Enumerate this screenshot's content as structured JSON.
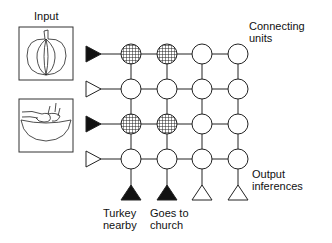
{
  "labels": {
    "input": "Input",
    "connecting_units": "Connecting\nunits",
    "output_inferences": "Output\ninferences"
  },
  "input_images": [
    {
      "name": "pumpkin-image",
      "description": "pumpkin"
    },
    {
      "name": "bowl-image",
      "description": "hands in bowl"
    }
  ],
  "input_units": [
    {
      "active": true
    },
    {
      "active": false
    },
    {
      "active": true
    },
    {
      "active": false
    }
  ],
  "connecting_units": [
    [
      true,
      true,
      false,
      false
    ],
    [
      false,
      false,
      false,
      false
    ],
    [
      true,
      true,
      false,
      false
    ],
    [
      false,
      false,
      false,
      false
    ]
  ],
  "output_units": [
    {
      "active": true,
      "label": "Turkey\nnearby"
    },
    {
      "active": true,
      "label": "Goes to\nchurch"
    },
    {
      "active": false,
      "label": ""
    },
    {
      "active": false,
      "label": ""
    }
  ],
  "colors": {
    "stroke": "#222222",
    "active_fill": "#111111",
    "hatched_fill": "#777777"
  }
}
